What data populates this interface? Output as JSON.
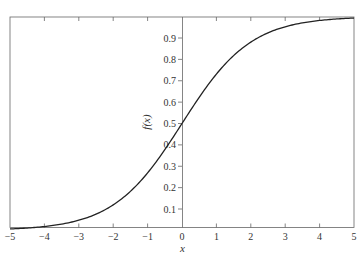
{
  "chart_data": {
    "type": "line",
    "title": "",
    "xlabel": "x",
    "ylabel": "f(x)",
    "xlim": [
      -5,
      5
    ],
    "ylim": [
      0.0067,
      0.9933
    ],
    "grid": false,
    "legend": null,
    "function": "f(x) = 1 / (1 + e^(-x))",
    "x_ticks": [
      -5,
      -4,
      -3,
      -2,
      -1,
      0,
      1,
      2,
      3,
      4,
      5
    ],
    "x_tick_labels": [
      "−5",
      "−4",
      "−3",
      "−2",
      "−1",
      "0",
      "1",
      "2",
      "3",
      "4",
      "5"
    ],
    "y_ticks": [
      0.1,
      0.2,
      0.3,
      0.4,
      0.5,
      0.6,
      0.7,
      0.8,
      0.9
    ],
    "y_tick_labels": [
      "0.1",
      "0.2",
      "0.3",
      "0.4",
      "0.5",
      "0.6",
      "0.7",
      "0.8",
      "0.9"
    ],
    "series": [
      {
        "name": "f(x)",
        "x": [
          -5,
          -4.5,
          -4,
          -3.5,
          -3,
          -2.5,
          -2,
          -1.5,
          -1,
          -0.5,
          0,
          0.5,
          1,
          1.5,
          2,
          2.5,
          3,
          3.5,
          4,
          4.5,
          5
        ],
        "values": [
          0.0067,
          0.011,
          0.018,
          0.0293,
          0.0474,
          0.0759,
          0.1192,
          0.1824,
          0.2689,
          0.3775,
          0.5,
          0.6225,
          0.7311,
          0.8176,
          0.8808,
          0.9241,
          0.9526,
          0.9707,
          0.982,
          0.989,
          0.9933
        ]
      }
    ],
    "colors": {
      "line": "#222222",
      "axes": "#555555",
      "text": "#333333"
    }
  }
}
